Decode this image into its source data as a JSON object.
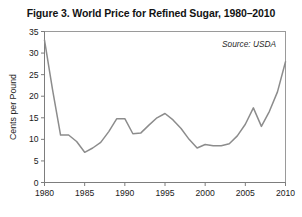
{
  "figure": {
    "title": "Figure 3. World Price for Refined Sugar, 1980–2010",
    "source_note": "Source: USDA",
    "background_color": "#ffffff",
    "line_color": "#8c8c8c",
    "axis_color": "#8a8a8a",
    "text_color": "#131313"
  },
  "chart_data": {
    "type": "line",
    "title": "Figure 3. World Price for Refined Sugar, 1980–2010",
    "subtitle": "",
    "xlabel": "",
    "ylabel": "Cents per Pound",
    "annotation": "Source: USDA",
    "annotation_position": "top-right-inside",
    "legend": false,
    "grid": false,
    "xlim": [
      1980,
      2010
    ],
    "ylim": [
      0,
      35
    ],
    "xticks": [
      1980,
      1985,
      1990,
      1995,
      2000,
      2005,
      2010
    ],
    "xtick_labels": [
      "1980",
      "1985",
      "1990",
      "1995",
      "2000",
      "2005",
      "2010"
    ],
    "yticks": [
      0,
      5,
      10,
      15,
      20,
      25,
      30,
      35
    ],
    "ytick_labels": [
      "0",
      "5",
      "10",
      "15",
      "20",
      "25",
      "30",
      "35"
    ],
    "series": [
      {
        "name": "World Price for Refined Sugar",
        "color": "#8c8c8c",
        "x": [
          1980,
          1981,
          1982,
          1983,
          1984,
          1985,
          1986,
          1987,
          1988,
          1989,
          1990,
          1991,
          1992,
          1993,
          1994,
          1995,
          1996,
          1997,
          1998,
          1999,
          2000,
          2001,
          2002,
          2003,
          2004,
          2005,
          2006,
          2007,
          2008,
          2009,
          2010
        ],
        "y": [
          33.0,
          21.5,
          11.0,
          11.0,
          9.5,
          7.0,
          8.0,
          9.3,
          11.8,
          14.8,
          14.8,
          11.3,
          11.5,
          13.3,
          15.0,
          16.0,
          14.5,
          12.5,
          10.0,
          8.0,
          8.8,
          8.5,
          8.5,
          9.0,
          10.8,
          13.5,
          17.3,
          13.0,
          16.5,
          21.0,
          28.0
        ]
      }
    ]
  }
}
